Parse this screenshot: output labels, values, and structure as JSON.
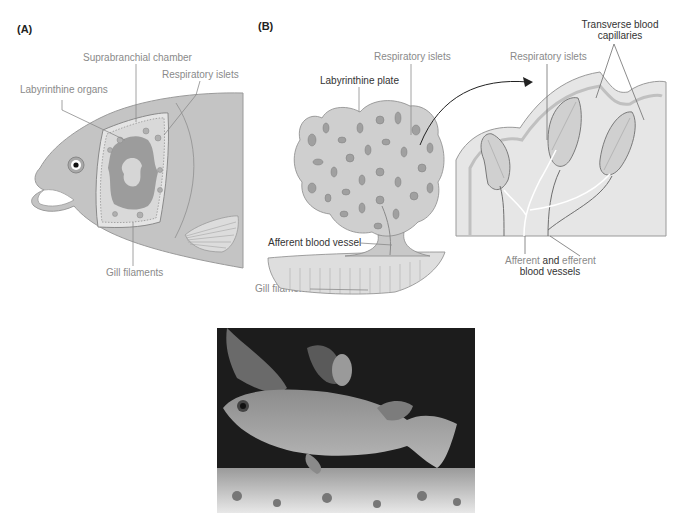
{
  "figure": {
    "top_cut_text": "Respiratory system",
    "panel_a": {
      "label": "(A)",
      "labels": {
        "suprabranchial": "Suprabranchial chamber",
        "respiratory_islets": "Respiratory islets",
        "labyrinthine_organs": "Labyrinthine organs",
        "gill_filaments": "Gill filaments"
      }
    },
    "panel_b": {
      "label": "(B)",
      "labels": {
        "respiratory_islets_left": "Respiratory islets",
        "labyrinthine_plate": "Labyrinthine plate",
        "afferent_vessel": "Afferent blood vessel",
        "gill_filaments": "Gill filaments",
        "respiratory_islets_right": "Respiratory islets",
        "transverse_line1": "Transverse blood",
        "transverse_line2": "capillaries",
        "afferent_word": "Afferent",
        "and_word": " and ",
        "efferent_word": "efferent",
        "blood_vessels": "blood vessels"
      }
    },
    "photo": {
      "description": "Photograph of a fish with a labyrinth organ in an aquarium"
    },
    "colors": {
      "fish_body": "#c4c4c4",
      "organ_dark": "#9c9c9c",
      "organ_light": "#d9d9d9",
      "outline": "#8a8a8a",
      "label_gray": "#8a8a8a",
      "label_dark": "#333333"
    }
  }
}
